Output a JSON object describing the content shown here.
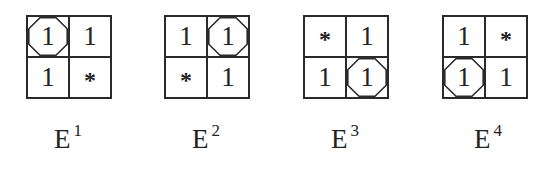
{
  "figure": {
    "panels": [
      {
        "label_base": "E",
        "label_superscript": "1",
        "cells": [
          {
            "value": "1",
            "circled": true
          },
          {
            "value": "1",
            "circled": false
          },
          {
            "value": "1",
            "circled": false
          },
          {
            "value": "*",
            "circled": false
          }
        ]
      },
      {
        "label_base": "E",
        "label_superscript": "2",
        "cells": [
          {
            "value": "1",
            "circled": false
          },
          {
            "value": "1",
            "circled": true
          },
          {
            "value": "*",
            "circled": false
          },
          {
            "value": "1",
            "circled": false
          }
        ]
      },
      {
        "label_base": "E",
        "label_superscript": "3",
        "cells": [
          {
            "value": "*",
            "circled": false
          },
          {
            "value": "1",
            "circled": false
          },
          {
            "value": "1",
            "circled": false
          },
          {
            "value": "1",
            "circled": true
          }
        ]
      },
      {
        "label_base": "E",
        "label_superscript": "4",
        "cells": [
          {
            "value": "1",
            "circled": false
          },
          {
            "value": "*",
            "circled": false
          },
          {
            "value": "1",
            "circled": true
          },
          {
            "value": "1",
            "circled": false
          }
        ]
      }
    ]
  }
}
